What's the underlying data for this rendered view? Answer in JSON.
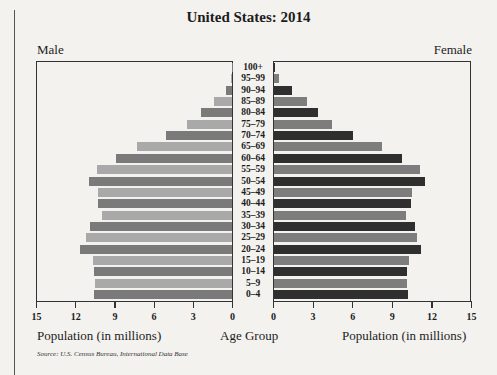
{
  "title": "United States: 2014",
  "labels": {
    "male": "Male",
    "female": "Female",
    "age_group": "Age Group",
    "male_axis": "Population (in millions)",
    "female_axis": "Population (in millions)",
    "source": "Source: U.S. Census Bureau, International Data Base"
  },
  "colors": {
    "male_light": "#a9a9a9",
    "male_dark": "#7a7a7a",
    "female_light": "#7d7d7d",
    "female_dark": "#2f2f2f"
  },
  "chart_data": {
    "type": "bar",
    "subtype": "population-pyramid",
    "title": "United States: 2014",
    "categories": [
      "100+",
      "95–99",
      "90–94",
      "85–89",
      "80–84",
      "75–79",
      "70–74",
      "65–69",
      "60–64",
      "55–59",
      "50–54",
      "45–49",
      "40–44",
      "35–39",
      "30–34",
      "25–29",
      "20–24",
      "15–19",
      "10–14",
      "5–9",
      "0–4"
    ],
    "series": [
      {
        "name": "Male",
        "values": [
          0.02,
          0.1,
          0.5,
          1.4,
          2.4,
          3.5,
          5.1,
          7.3,
          8.9,
          10.4,
          11.0,
          10.3,
          10.3,
          10.0,
          10.9,
          11.2,
          11.7,
          10.7,
          10.6,
          10.5,
          10.6
        ]
      },
      {
        "name": "Female",
        "values": [
          0.07,
          0.4,
          1.4,
          2.5,
          3.4,
          4.4,
          6.0,
          8.2,
          9.7,
          11.1,
          11.5,
          10.5,
          10.4,
          10.0,
          10.7,
          10.9,
          11.2,
          10.3,
          10.1,
          10.1,
          10.2
        ]
      }
    ],
    "xlabel": "Population (in millions)",
    "ylabel": "Age Group",
    "xlim": [
      0,
      15
    ],
    "xticks": [
      0,
      3,
      6,
      9,
      12,
      15
    ],
    "legend": [
      "Male (left)",
      "Female (right)"
    ],
    "grid": false,
    "source": "Source: U.S. Census Bureau, International Data Base"
  }
}
